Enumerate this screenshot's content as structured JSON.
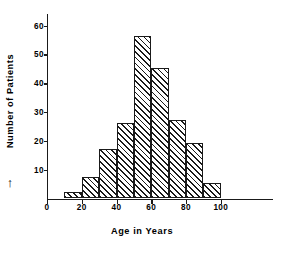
{
  "chart_data": {
    "type": "bar",
    "title": "",
    "subtitle": "",
    "xlabel": "Age in Years",
    "ylabel": "Number of Patients",
    "ylabel_arrow": "↑",
    "categories": [
      "10-20",
      "20-30",
      "30-40",
      "40-50",
      "50-60",
      "60-70",
      "70-80",
      "80-90",
      "90-100"
    ],
    "bin_edges": [
      10,
      20,
      30,
      40,
      50,
      60,
      70,
      80,
      90,
      100
    ],
    "values": [
      2,
      7,
      17,
      26,
      56,
      45,
      27,
      19,
      5
    ],
    "xlim": [
      0,
      130
    ],
    "ylim": [
      0,
      64
    ],
    "xticks": [
      0,
      20,
      40,
      60,
      80,
      100
    ],
    "xtick_labels": [
      "0",
      "20",
      "40",
      "60",
      "80",
      "100"
    ],
    "yticks": [
      10,
      20,
      30,
      40,
      50,
      60
    ],
    "ytick_labels": [
      "10",
      "20",
      "30",
      "40",
      "50",
      "60"
    ],
    "grid": false,
    "legend": null,
    "bar_style": {
      "fill": "hatched-diagonal",
      "hatch": "///",
      "edge_color": "#1a1a1a",
      "face_color": "#ffffff"
    },
    "axis_color": "#1a1a1a",
    "background_color": "#ffffff"
  }
}
